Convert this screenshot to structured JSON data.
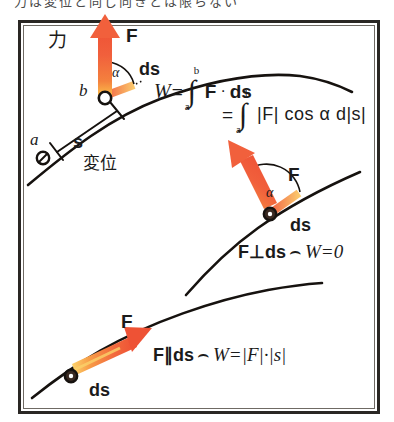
{
  "figure": {
    "top_caption": "力は変位と同じ向きとは限らない",
    "title_hidden": true
  },
  "panels": [
    {
      "id": "panel-general",
      "force_label": "F",
      "force_word_jp": "力",
      "point_start": "a",
      "point_end": "b",
      "tangent_label": "ds",
      "angle_label": "α",
      "displacement_label": "s",
      "displacement_word_jp": "変位",
      "formula_line1": {
        "lhs": "W",
        "eq": "=",
        "integral": "∫",
        "upper": "b",
        "lower": "a",
        "body_a": "F",
        "dot": "·",
        "body_b": "ds"
      },
      "formula_line2": {
        "eq": "=",
        "integral": "∫",
        "upper": "b",
        "lower": "a",
        "body": "|F| cos α d|s|"
      }
    },
    {
      "id": "panel-perpendicular",
      "force_label": "F",
      "tangent_label": "ds",
      "angle_label": "α",
      "relation": "F⊥ds",
      "implies": "⌢",
      "result": "W=0"
    },
    {
      "id": "panel-parallel",
      "force_label": "F",
      "tangent_label": "ds",
      "relation": "F∥ds",
      "implies": "⌢",
      "result": "W=|F|·|s|"
    }
  ],
  "colors": {
    "arrow_head": "#F1603C",
    "arrow_tail": "#FBBF4A",
    "curve": "#16120f",
    "frame": "#2a2724",
    "text": "#1b1b1b",
    "background": "#ffffff"
  }
}
